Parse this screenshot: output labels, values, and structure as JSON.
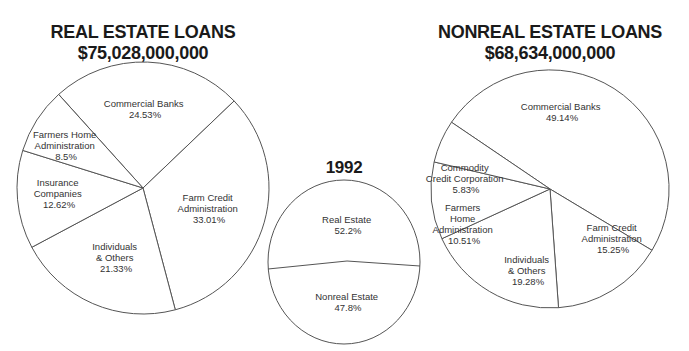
{
  "chart_data": [
    {
      "type": "pie",
      "title": "REAL ESTATE LOANS",
      "subtitle": "$75,028,000,000",
      "slices": [
        {
          "label": "Commercial Banks",
          "value": 24.53,
          "text": "24.53%"
        },
        {
          "label": "Farm Credit Administration",
          "value": 33.01,
          "text": "33.01%"
        },
        {
          "label": "Individuals & Others",
          "value": 21.33,
          "text": "21.33%"
        },
        {
          "label": "Insurance Companies",
          "value": 12.62,
          "text": "12.62%"
        },
        {
          "label": "Farmers Home Administration",
          "value": 8.5,
          "text": "8.5%"
        }
      ]
    },
    {
      "type": "pie",
      "title": "1992",
      "slices": [
        {
          "label": "Real Estate",
          "value": 52.2,
          "text": "52.2%"
        },
        {
          "label": "Nonreal Estate",
          "value": 47.8,
          "text": "47.8%"
        }
      ]
    },
    {
      "type": "pie",
      "title": "NONREAL ESTATE LOANS",
      "subtitle": "$68,634,000,000",
      "slices": [
        {
          "label": "Commercial Banks",
          "value": 49.14,
          "text": "49.14%"
        },
        {
          "label": "Farm Credit Administration",
          "value": 15.25,
          "text": "15.25%"
        },
        {
          "label": "Individuals & Others",
          "value": 19.28,
          "text": "19.28%"
        },
        {
          "label": "Farmers Home Administration",
          "value": 10.51,
          "text": "10.51%"
        },
        {
          "label": "Commodity Credit Corporation",
          "value": 5.83,
          "text": "5.83%"
        }
      ]
    }
  ],
  "left": {
    "title": "REAL ESTATE LOANS",
    "amount": "$75,028,000,000",
    "labels": {
      "commercial_banks": [
        "Commercial Banks",
        "24.53%"
      ],
      "farm_credit": [
        "Farm Credit",
        "Administration",
        "33.01%"
      ],
      "individuals": [
        "Individuals",
        "& Others",
        "21.33%"
      ],
      "insurance": [
        "Insurance",
        "Companies",
        "12.62%"
      ],
      "fmha": [
        "Farmers Home",
        "Administration",
        "8.5%"
      ]
    }
  },
  "middle": {
    "title": "1992",
    "labels": {
      "real_estate": [
        "Real Estate",
        "52.2%"
      ],
      "nonreal_estate": [
        "Nonreal Estate",
        "47.8%"
      ]
    }
  },
  "right": {
    "title": "NONREAL ESTATE LOANS",
    "amount": "$68,634,000,000",
    "labels": {
      "commercial_banks": [
        "Commercial Banks",
        "49.14%"
      ],
      "ccc": [
        "Commodity",
        "Credit Corporation",
        "5.83%"
      ],
      "fmha": [
        "Farmers",
        "Home",
        "Administration",
        "10.51%"
      ],
      "individuals": [
        "Individuals",
        "& Others",
        "19.28%"
      ],
      "farm_credit": [
        "Farm Credit",
        "Administration",
        "15.25%"
      ]
    }
  }
}
